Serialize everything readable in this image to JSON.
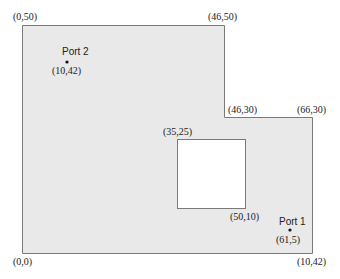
{
  "diagram": {
    "fill_color": "#e9e9e9",
    "stroke_color": "#7a7a7a",
    "hole_fill": "#ffffff",
    "corner_labels": {
      "top_left": "(0,50)",
      "top_notch": "(46,50)",
      "step_inner": "(46,30)",
      "step_outer": "(66,30)",
      "bottom_left": "(0,0)",
      "bottom_right": "(10,42)"
    },
    "hole_labels": {
      "top_left": "(35,25)",
      "bottom_right": "(50,10)"
    },
    "ports": [
      {
        "name": "Port 2",
        "coord": "(10,42)"
      },
      {
        "name": "Port 1",
        "coord": "(61,5)"
      }
    ]
  }
}
